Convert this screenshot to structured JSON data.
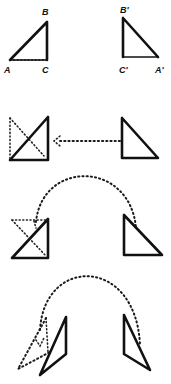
{
  "figure": {
    "ink_color": "#111111",
    "background": "#ffffff"
  },
  "rows": [
    {
      "step": 1,
      "left_triangle": {
        "labels": {
          "top": "B",
          "bottom_left": "A",
          "bottom_right": "C"
        }
      },
      "right_triangle": {
        "labels": {
          "top": "B'",
          "bottom_left": "C'",
          "bottom_right": "A'"
        }
      }
    },
    {
      "step": 2,
      "motion": "straight dotted arrow from right triangle to left triangle (translation)"
    },
    {
      "step": 3,
      "motion": "dotted arc from left figure over to right triangle (flip)"
    },
    {
      "step": 4,
      "motion": "dotted arc with triangle tilting out of the plane"
    }
  ]
}
